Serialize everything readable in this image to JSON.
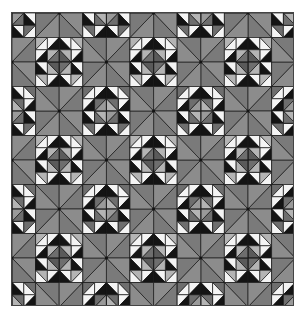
{
  "image": {
    "title": "Geometric quilt pattern",
    "description": "Grayscale quilt of alternating light octagon blocks, dark octagon blocks and X-star blocks"
  },
  "layout": {
    "origin_x": 0,
    "origin_y": 0,
    "step_x": 47.2,
    "step_y": 49,
    "block_size_x": 47.2,
    "block_size_y": 49,
    "columns": 7,
    "rows": 7,
    "frame_width": 283,
    "frame_height": 294
  },
  "rules": {
    "x_star": "(col+row) odd",
    "light_octagon": "(col+row) even and col odd",
    "dark_octagon": "(col+row) even and col even"
  },
  "colors": {
    "line": "#1a1a1a",
    "black": "#141414",
    "white": "#f4f4f4",
    "star_a": "#8c8c8c",
    "star_b": "#7a7a7a",
    "mid_gray": "#6e6e6e",
    "light_gray": "#b4b4b4",
    "center_dark": "#5a5a5a",
    "center_light": "#9a9a9a"
  }
}
